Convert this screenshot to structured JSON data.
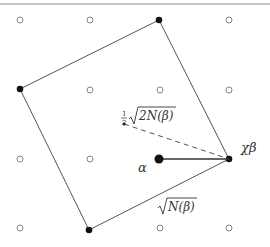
{
  "figure": {
    "width": 270,
    "height": 247,
    "top_rule_color": "#8a8a8a",
    "line_color": "#555555",
    "point_color": "#111111",
    "lattice_color": "#777777"
  },
  "lattice": {
    "spacing": 70,
    "points": [
      [
        20,
        20
      ],
      [
        90,
        20
      ],
      [
        229,
        20
      ],
      [
        90,
        90
      ],
      [
        160,
        90
      ],
      [
        229,
        90
      ],
      [
        20,
        159
      ],
      [
        90,
        159
      ],
      [
        20,
        228
      ],
      [
        160,
        228
      ],
      [
        229,
        228
      ]
    ]
  },
  "square": {
    "vertices": [
      [
        20,
        89
      ],
      [
        159,
        20
      ],
      [
        229,
        159
      ],
      [
        89,
        230
      ]
    ]
  },
  "points": {
    "alpha": {
      "x": 159,
      "y": 159,
      "label": "α"
    },
    "chi_beta": {
      "x": 229,
      "y": 159,
      "label": "χβ"
    },
    "center": {
      "x": 124,
      "y": 124
    }
  },
  "labels": {
    "half_sqrt": {
      "frac_num": "1",
      "frac_den": "2",
      "radicand": "2N(β)"
    },
    "side": {
      "radicand": "N(β)"
    }
  }
}
